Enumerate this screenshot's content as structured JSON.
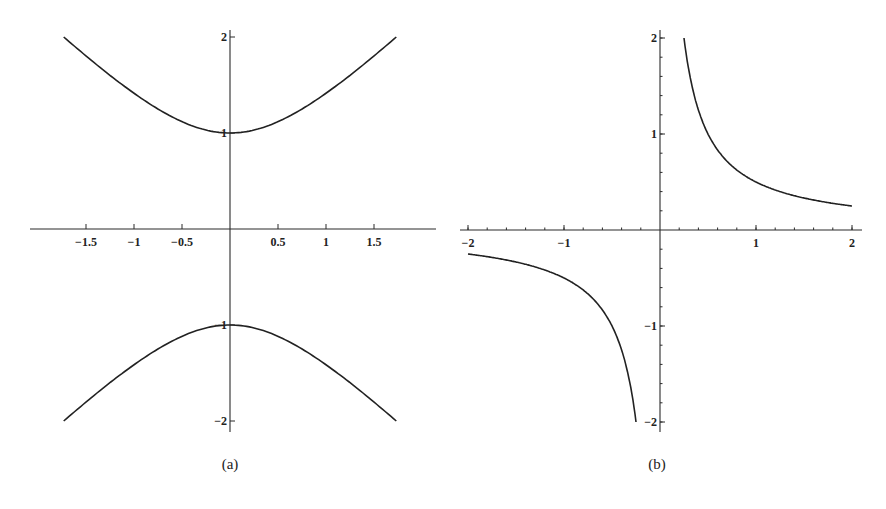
{
  "chart_data": [
    {
      "type": "line",
      "caption": "(a)",
      "description": "Hyperbola y^2 - x^2 = 1 (upper and lower branches)",
      "xlim": [
        -2.05,
        2.15
      ],
      "ylim": [
        -2.05,
        2.05
      ],
      "x_ticks": [
        -1.5,
        -1,
        -0.5,
        0.5,
        1,
        1.5
      ],
      "x_tick_labels": [
        "-1.5",
        "-1",
        "-0.5",
        "0.5",
        "1",
        "1.5"
      ],
      "y_ticks": [
        2,
        1,
        -1,
        -2
      ],
      "y_tick_labels": [
        "2",
        "1",
        "-1",
        "-2"
      ],
      "grid": false,
      "series": [
        {
          "name": "upper branch",
          "x": [
            -1.732,
            -1.5,
            -1,
            -0.5,
            0,
            0.5,
            1,
            1.5,
            1.732
          ],
          "y": [
            2,
            1.803,
            1.414,
            1.118,
            1,
            1.118,
            1.414,
            1.803,
            2
          ]
        },
        {
          "name": "lower branch",
          "x": [
            -1.732,
            -1.5,
            -1,
            -0.5,
            0,
            0.5,
            1,
            1.5,
            1.732
          ],
          "y": [
            -2,
            -1.803,
            -1.414,
            -1.118,
            -1,
            -1.118,
            -1.414,
            -1.803,
            -2
          ]
        }
      ]
    },
    {
      "type": "line",
      "caption": "(b)",
      "description": "Hyperbola xy = 1/2",
      "xlim": [
        -2.05,
        2.1
      ],
      "ylim": [
        -2.05,
        2.05
      ],
      "x_ticks": [
        -2,
        -1,
        1,
        2
      ],
      "x_tick_labels": [
        "-2",
        "-1",
        "1",
        "2"
      ],
      "x_minor_step": 0.2,
      "y_ticks": [
        2,
        1,
        -1,
        -2
      ],
      "y_tick_labels": [
        "2",
        "1",
        "-1",
        "-2"
      ],
      "y_minor_step": 0.2,
      "grid": false,
      "series": [
        {
          "name": "first-quadrant branch",
          "x": [
            0.25,
            0.5,
            1,
            1.5,
            2
          ],
          "y": [
            2,
            1,
            0.5,
            0.333,
            0.25
          ]
        },
        {
          "name": "third-quadrant branch",
          "x": [
            -2,
            -1.5,
            -1,
            -0.5,
            -0.25
          ],
          "y": [
            -0.25,
            -0.333,
            -0.5,
            -1,
            -2
          ]
        }
      ]
    }
  ],
  "captions": {
    "a": "(a)",
    "b": "(b)"
  },
  "colors": {
    "ink": "#222222",
    "background": "#ffffff"
  }
}
